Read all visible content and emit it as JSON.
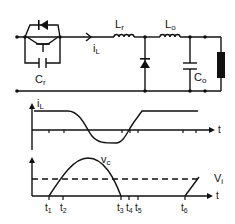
{
  "circuit": {
    "labels": {
      "switch_capacitor": "C",
      "switch_capacitor_sub": "r",
      "current": "i",
      "current_sub": "L",
      "resonant_inductor": "L",
      "resonant_inductor_sub": "r",
      "output_inductor": "L",
      "output_inductor_sub": "o",
      "output_capacitor": "C",
      "output_capacitor_sub": "o"
    }
  },
  "waveform_current": {
    "ylabel": "i",
    "ylabel_sub": "L",
    "xlabel": "t"
  },
  "waveform_voltage": {
    "curve_label": "v",
    "curve_label_sub": "c",
    "dashed_label": "V",
    "dashed_label_sub": "i",
    "xlabel": "t",
    "ticks": [
      {
        "t": "t",
        "sub": "1"
      },
      {
        "t": "t",
        "sub": "2"
      },
      {
        "t": "t",
        "sub": "3"
      },
      {
        "t": "t",
        "sub": "4"
      },
      {
        "t": "t",
        "sub": "5"
      },
      {
        "t": "t",
        "sub": "6"
      }
    ]
  }
}
